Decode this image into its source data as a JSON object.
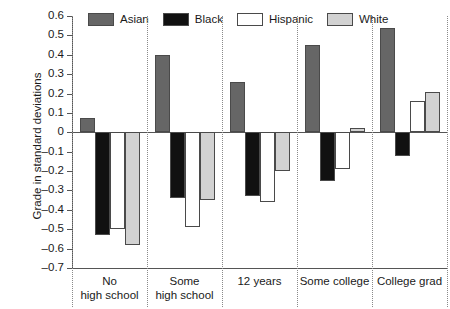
{
  "chart_data": {
    "type": "bar",
    "title": "",
    "xlabel": "",
    "ylabel": "Grade in standard deviations",
    "ylim": [
      -0.7,
      0.6
    ],
    "yticks": [
      0.6,
      0.5,
      0.4,
      0.3,
      0.2,
      0.1,
      0,
      -0.1,
      -0.2,
      -0.3,
      -0.4,
      -0.5,
      -0.6,
      -0.7
    ],
    "ytick_labels": [
      "0.6",
      "0.5",
      "0.4",
      "0.3",
      "0.2",
      "0.1",
      "0",
      "–0.1",
      "–0.2",
      "–0.3",
      "–0.4",
      "–0.5",
      "–0.6",
      "–0.7"
    ],
    "grid": false,
    "legend_position": "top",
    "categories": [
      "No high school",
      "Some high school",
      "12 years",
      "Some college",
      "College grad"
    ],
    "category_lines": [
      [
        "No",
        "high school"
      ],
      [
        "Some",
        "high school"
      ],
      [
        "12 years"
      ],
      [
        "Some college"
      ],
      [
        "College grad"
      ]
    ],
    "series": [
      {
        "name": "Asian",
        "color": "#666666",
        "values": [
          0.075,
          0.4,
          0.26,
          0.45,
          0.54
        ]
      },
      {
        "name": "Black",
        "color": "#111111",
        "values": [
          -0.53,
          -0.34,
          -0.33,
          -0.25,
          -0.12
        ]
      },
      {
        "name": "Hispanic",
        "color": "#ffffff",
        "values": [
          -0.5,
          -0.49,
          -0.36,
          -0.19,
          0.16
        ]
      },
      {
        "name": "White",
        "color": "#d2d2d2",
        "values": [
          -0.58,
          -0.35,
          -0.2,
          0.02,
          0.21
        ]
      }
    ]
  },
  "legend": {
    "items": [
      {
        "label": "Asian"
      },
      {
        "label": "Black"
      },
      {
        "label": "Hispanic"
      },
      {
        "label": "White"
      }
    ]
  }
}
